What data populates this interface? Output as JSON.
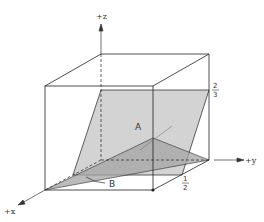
{
  "diagram": {
    "type": "3d-unit-cube-planes",
    "axes": {
      "x_label": "+x",
      "y_label": "+y",
      "z_label": "+z"
    },
    "labels": {
      "plane_a": "A",
      "plane_b": "B"
    },
    "intercepts": {
      "z_top": {
        "num": "2",
        "den": "3"
      },
      "y_half": {
        "num": "1",
        "den": "2"
      }
    },
    "colors": {
      "edge": "#222222",
      "plane_a_fill": "#c8c8c8",
      "plane_b_fill": "#9a9a9a",
      "background": "#ffffff"
    }
  }
}
